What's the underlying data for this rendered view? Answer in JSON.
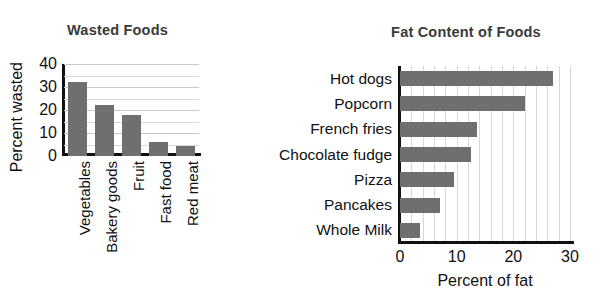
{
  "chart_data": [
    {
      "type": "bar",
      "id": "wasted-foods",
      "title": "Wasted Foods",
      "xlabel": "",
      "ylabel": "Percent wasted",
      "categories": [
        "Vegetables",
        "Bakery goods",
        "Fruit",
        "Fast food",
        "Red meat"
      ],
      "values": [
        32,
        22,
        18,
        6,
        4.5
      ],
      "ylim": [
        0,
        40
      ],
      "yticks": [
        0,
        10,
        20,
        30,
        40
      ],
      "ytick_labels": [
        "0",
        "10",
        "20",
        "30",
        "40"
      ],
      "minor_gridlines_every": 5,
      "grid": true,
      "legend": "none",
      "bar_color": "#6f6f6f",
      "orientation": "vertical"
    },
    {
      "type": "bar",
      "id": "fat-content-of-foods",
      "title": "Fat Content of Foods",
      "xlabel": "Percent of fat",
      "ylabel": "",
      "categories": [
        "Hot dogs",
        "Popcorn",
        "French fries",
        "Chocolate fudge",
        "Pizza",
        "Pancakes",
        "Whole Milk"
      ],
      "values": [
        27,
        22,
        13.5,
        12.5,
        9.5,
        7,
        3.5
      ],
      "xlim": [
        0,
        30
      ],
      "xticks": [
        0,
        10,
        20,
        30
      ],
      "xtick_labels": [
        "0",
        "10",
        "20",
        "30"
      ],
      "minor_gridlines_every": 2,
      "grid": true,
      "legend": "none",
      "bar_color": "#6f6f6f",
      "orientation": "horizontal"
    }
  ],
  "left_chart": {
    "title": "Wasted Foods",
    "y_axis_title": "Percent wasted",
    "y_ticks": [
      "40",
      "30",
      "20",
      "10",
      "0"
    ],
    "bars": [
      {
        "label": "Vegetables",
        "value": 32
      },
      {
        "label": "Bakery goods",
        "value": 22
      },
      {
        "label": "Fruit",
        "value": 18
      },
      {
        "label": "Fast food",
        "value": 6
      },
      {
        "label": "Red meat",
        "value": 4.5
      }
    ]
  },
  "right_chart": {
    "title": "Fat Content of Foods",
    "x_axis_title": "Percent of fat",
    "x_ticks": [
      "0",
      "10",
      "20",
      "30"
    ],
    "bars": [
      {
        "label": "Hot dogs",
        "value": 27
      },
      {
        "label": "Popcorn",
        "value": 22
      },
      {
        "label": "French fries",
        "value": 13.5
      },
      {
        "label": "Chocolate fudge",
        "value": 12.5
      },
      {
        "label": "Pizza",
        "value": 9.5
      },
      {
        "label": "Pancakes",
        "value": 7
      },
      {
        "label": "Whole Milk",
        "value": 3.5
      }
    ]
  },
  "style": {
    "bar_color": "#6f6f6f",
    "gridline_color": "#c9c9c9",
    "axis_color": "#111111",
    "title_color": "#3a3a3a",
    "background": "#ffffff"
  }
}
